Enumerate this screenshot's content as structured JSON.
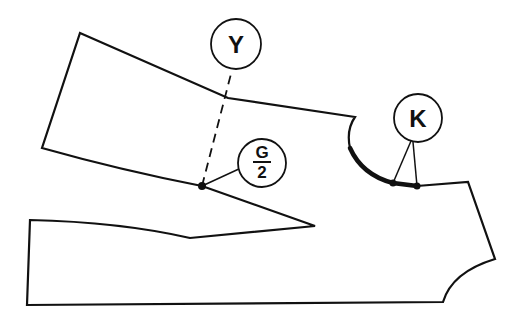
{
  "diagram": {
    "type": "sewing-pattern",
    "stroke_color": "#111111",
    "background": "#ffffff",
    "labels": {
      "y": "Y",
      "g_numerator": "G",
      "g_denominator": "2",
      "k": "K"
    },
    "callouts": [
      {
        "id": "Y",
        "text": "Y",
        "center": [
          236,
          44
        ],
        "radius": 25
      },
      {
        "id": "G/2",
        "text": "G/2",
        "center": [
          262,
          163
        ],
        "radius": 24
      },
      {
        "id": "K",
        "text": "K",
        "center": [
          418,
          118
        ],
        "radius": 24
      }
    ],
    "points": {
      "g_half_point": [
        202,
        186
      ],
      "k_point_1": [
        393,
        183
      ],
      "k_point_2": [
        417,
        186
      ]
    }
  }
}
